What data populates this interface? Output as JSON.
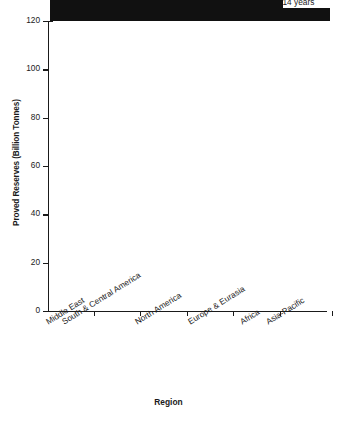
{
  "chart_data": {
    "type": "bar",
    "title": "",
    "xlabel": "Region",
    "ylabel": "Proved Reserves (Billion Tonnes)",
    "categories": [
      "Middle East",
      "South & Central America",
      "North America",
      "Europe & Eurasia",
      "Africa",
      "Asia-Pacific"
    ],
    "values": [
      113,
      51,
      35,
      20,
      18.5,
      5.5
    ],
    "point_labels": [
      "78.1 years",
      "136.5 years",
      "37.4 years",
      "23.5 years",
      "40.5 years",
      "14 years"
    ],
    "ylim": [
      0,
      120
    ],
    "yticks": [
      0,
      20,
      40,
      60,
      80,
      100,
      120
    ],
    "ytick_labels": [
      "0",
      "20",
      "40",
      "60",
      "80",
      "100",
      "120"
    ],
    "grid": false,
    "legend": false,
    "bar_color": "#111111",
    "axis_color": "#1a1a1a",
    "background": "#ffffff"
  }
}
